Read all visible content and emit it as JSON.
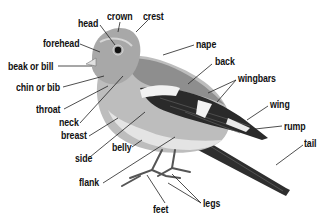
{
  "colors": {
    "line": "#222222",
    "body_light": "#c9c9c9",
    "body_mid": "#9a9a9a",
    "head": "#a5a5a5",
    "wing_dark": "#2a2a2a",
    "wingbar": "#f2f2f2",
    "belly": "#e2e2e2"
  },
  "labels": [
    {
      "id": "head",
      "text": "head",
      "x": 78,
      "y": 19
    },
    {
      "id": "crown",
      "text": "crown",
      "x": 107,
      "y": 12
    },
    {
      "id": "crest",
      "text": "crest",
      "x": 143,
      "y": 12
    },
    {
      "id": "forehead",
      "text": "forehead",
      "x": 43,
      "y": 39
    },
    {
      "id": "beak",
      "text": "beak or bill",
      "x": 8,
      "y": 62
    },
    {
      "id": "chin",
      "text": "chin or bib",
      "x": 16,
      "y": 83
    },
    {
      "id": "throat",
      "text": "throat",
      "x": 36,
      "y": 105
    },
    {
      "id": "neck",
      "text": "neck",
      "x": 59,
      "y": 118
    },
    {
      "id": "breast",
      "text": "breast",
      "x": 61,
      "y": 131
    },
    {
      "id": "side",
      "text": "side",
      "x": 75,
      "y": 154
    },
    {
      "id": "belly",
      "text": "belly",
      "x": 112,
      "y": 143
    },
    {
      "id": "flank",
      "text": "flank",
      "x": 79,
      "y": 178
    },
    {
      "id": "feet",
      "text": "feet",
      "x": 153,
      "y": 205
    },
    {
      "id": "legs",
      "text": "legs",
      "x": 203,
      "y": 199
    },
    {
      "id": "nape",
      "text": "nape",
      "x": 196,
      "y": 40
    },
    {
      "id": "back",
      "text": "back",
      "x": 215,
      "y": 57
    },
    {
      "id": "wingbars",
      "text": "wingbars",
      "x": 238,
      "y": 74
    },
    {
      "id": "wing",
      "text": "wing",
      "x": 270,
      "y": 100
    },
    {
      "id": "rump",
      "text": "rump",
      "x": 284,
      "y": 122
    },
    {
      "id": "tail",
      "text": "tail",
      "x": 304,
      "y": 139
    }
  ]
}
